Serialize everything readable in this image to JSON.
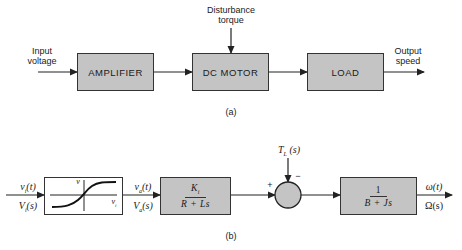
{
  "diagram_a": {
    "caption": "(a)",
    "input_label_line1": "Input",
    "input_label_line2": "voltage",
    "disturbance_label_line1": "Disturbance",
    "disturbance_label_line2": "torque",
    "output_label_line1": "Output",
    "output_label_line2": "speed",
    "blocks": [
      {
        "label": "AMPLIFIER"
      },
      {
        "label": "DC MOTOR"
      },
      {
        "label": "LOAD"
      }
    ]
  },
  "diagram_b": {
    "caption": "(b)",
    "input_time": "v_i(t)",
    "input_s": "V_i(s)",
    "saturation_block": {
      "y_axis_label": "v",
      "x_axis_label": "v_i"
    },
    "mid_time": "v_a(t)",
    "mid_s": "V_a(s)",
    "block_k": {
      "numerator": "K_i",
      "denominator": "R + Ls"
    },
    "summing_junction": {
      "plus": "+",
      "minus": "−"
    },
    "disturbance": "T_L(s)",
    "block_mech": {
      "numerator": "1",
      "denominator": "B + Js"
    },
    "output_time": "ω(t)",
    "output_s": "Ω(s)"
  },
  "colors": {
    "block_fill": "#c4c4c4",
    "line": "#222222",
    "background": "#ffffff"
  }
}
